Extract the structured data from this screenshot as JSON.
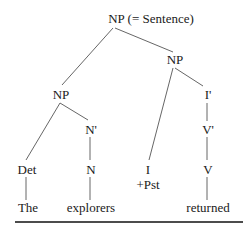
{
  "tree": {
    "root": "NP (= Sentence)",
    "np_left": "NP",
    "np_right": "NP",
    "n_bar": "N'",
    "i_bar": "I'",
    "v_bar": "V'",
    "det": "Det",
    "n": "N",
    "i": "I",
    "i_feature": "+Pst",
    "v": "V",
    "words": [
      "The",
      "explorers",
      "returned"
    ]
  },
  "colors": {
    "line": "#444444",
    "text": "#1a1a1a",
    "rule": "#111111"
  }
}
